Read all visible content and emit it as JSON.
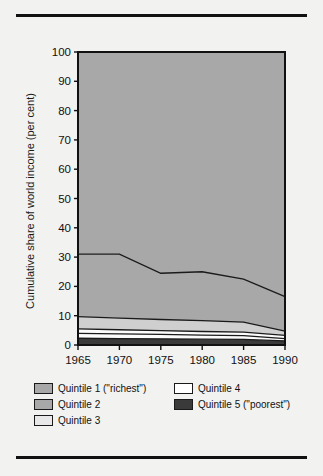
{
  "figure": {
    "background": "#f2f2f0",
    "rule_color": "#111111"
  },
  "chart_data": {
    "type": "area",
    "title": "",
    "subtitle": "",
    "xlabel": "",
    "ylabel": "Cumulative share of world income (per cent)",
    "x": [
      1965,
      1970,
      1975,
      1980,
      1985,
      1990
    ],
    "xticklabels": [
      "1965",
      "1970",
      "1975",
      "1980",
      "1985",
      "1990"
    ],
    "yticklabels": [
      "0",
      "10",
      "20",
      "30",
      "40",
      "50",
      "60",
      "70",
      "80",
      "90",
      "100"
    ],
    "yticks": [
      0,
      10,
      20,
      30,
      40,
      50,
      60,
      70,
      80,
      90,
      100
    ],
    "ylim": [
      0,
      100
    ],
    "xlim": [
      1965,
      1990
    ],
    "grid": false,
    "legend_position": "below-plot",
    "stacking": "cumulative-from-bottom",
    "series": [
      {
        "name": "Quintile 1 (\"richest\")",
        "cumulative_values": [
          100,
          100,
          100,
          100,
          100,
          100
        ],
        "color": "#a8a8a8",
        "swatch_color": "#a8a8a8"
      },
      {
        "name": "Quintile 2",
        "cumulative_values": [
          31.0,
          31.0,
          24.5,
          25.0,
          22.5,
          16.5
        ],
        "color": "#a8a8a8",
        "swatch_color": "#a8a8a8"
      },
      {
        "name": "Quintile 3",
        "cumulative_values": [
          9.7,
          9.2,
          8.7,
          8.3,
          7.8,
          4.7
        ],
        "color": "#cfcfcf",
        "swatch_color": "#e8e8e8"
      },
      {
        "name": "Quintile 4",
        "cumulative_values": [
          5.5,
          5.2,
          4.9,
          4.6,
          4.4,
          3.3
        ],
        "color": "#fbfbfb",
        "swatch_color": "#ffffff"
      },
      {
        "name": "Quintile 5 (\"poorest\")",
        "cumulative_values": [
          4.0,
          3.8,
          3.6,
          3.4,
          3.2,
          2.2
        ],
        "color": "#fbfbfb",
        "swatch_color": "#3a3a3a"
      },
      {
        "name": "baseline",
        "cumulative_values": [
          2.3,
          2.2,
          2.1,
          2.0,
          1.9,
          1.4
        ],
        "color": "#3a3a3a",
        "swatch_color": "#3a3a3a"
      }
    ]
  },
  "legend": {
    "items": [
      {
        "label": "Quintile 1 (\"richest\")",
        "color": "#a8a8a8"
      },
      {
        "label": "Quintile 4",
        "color": "#ffffff"
      },
      {
        "label": "Quintile 2",
        "color": "#a8a8a8"
      },
      {
        "label": "Quintile 5 (\"poorest\")",
        "color": "#3a3a3a"
      },
      {
        "label": "Quintile 3",
        "color": "#e8e8e8"
      }
    ]
  }
}
